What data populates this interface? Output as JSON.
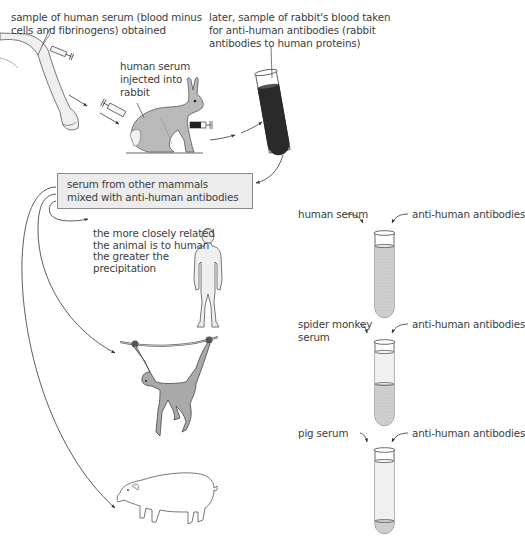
{
  "labels": {
    "serum_sample_line1": "sample of human serum (blood minus",
    "serum_sample_line2": "cells and fibrinogens) obtained",
    "injected_line1": "human serum",
    "injected_line2": "injected into",
    "injected_line3": "rabbit",
    "rabbit_blood_line1": "later, sample of rabbit's blood taken",
    "rabbit_blood_line2": "for anti-human antibodies (rabbit",
    "rabbit_blood_line3": "antibodies to human proteins)",
    "box_line1": "serum from other mammals",
    "box_line2": "mixed with anti-human antibodies",
    "conclusion_line1": "the more closely related",
    "conclusion_line2": "the animal is to human",
    "conclusion_line3": "the greater the",
    "conclusion_line4": "precipitation"
  },
  "tubes": [
    {
      "serum_label": "human serum",
      "serum_label_line2": "",
      "antibody_label": "anti-human antibodies",
      "precipitation": "high"
    },
    {
      "serum_label": "spider monkey",
      "serum_label_line2": "serum",
      "antibody_label": "anti-human antibodies",
      "precipitation": "medium"
    },
    {
      "serum_label": "pig serum",
      "serum_label_line2": "",
      "antibody_label": "anti-human antibodies",
      "precipitation": "low"
    }
  ],
  "figures": [
    "human-arm",
    "rabbit",
    "blood-tube",
    "human",
    "spider-monkey",
    "pig"
  ],
  "colors": {
    "line": "#333333",
    "box_fill": "#ececec",
    "animal_fill": "#b5b5b5",
    "blood": "#2a2a2a",
    "precipitate": "#cfcfcf"
  }
}
